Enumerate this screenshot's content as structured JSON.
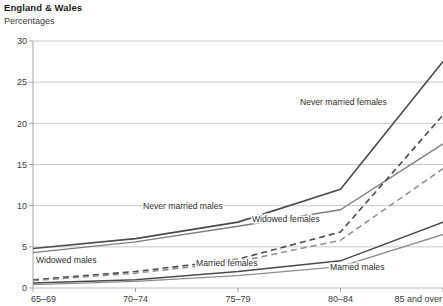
{
  "header": {
    "title": "England & Wales",
    "subtitle": "Percentages"
  },
  "chart_data": {
    "type": "line",
    "title": "England & Wales",
    "subtitle": "Percentages",
    "xlabel": "",
    "ylabel": "Percentages",
    "ylim": [
      0,
      30
    ],
    "yticks": [
      0,
      5,
      10,
      15,
      20,
      25,
      30
    ],
    "grid": true,
    "legend": "inline-annotations",
    "categories": [
      "65–69",
      "70–74",
      "75–79",
      "80–84",
      "85 and over"
    ],
    "series": [
      {
        "name": "Never married females",
        "values": [
          4.8,
          6.0,
          8.0,
          12.0,
          27.5
        ],
        "style": "solid",
        "color": "#4a4a4a",
        "width": 1.6,
        "label": "Never married females",
        "label_x": 300,
        "label_y": 105
      },
      {
        "name": "Never married males",
        "values": [
          4.3,
          5.6,
          7.5,
          9.5,
          17.5
        ],
        "style": "solid",
        "color": "#7d7d7d",
        "width": 1.4,
        "label": "Never married males",
        "label_x": 143,
        "label_y": 209
      },
      {
        "name": "Married females",
        "values": [
          1.0,
          2.0,
          3.5,
          6.8,
          21.0
        ],
        "style": "dashed",
        "color": "#4a4a4a",
        "width": 1.6,
        "label": "Married females",
        "label_x": 196,
        "label_y": 266
      },
      {
        "name": "Widowed females",
        "values": [
          0.9,
          1.8,
          3.2,
          5.8,
          14.5
        ],
        "style": "dashed",
        "color": "#8d8d8d",
        "width": 1.5,
        "label": "Widowed females",
        "label_x": 252,
        "label_y": 222
      },
      {
        "name": "Married males",
        "values": [
          0.6,
          1.0,
          2.0,
          3.3,
          8.0
        ],
        "style": "solid",
        "color": "#4a4a4a",
        "width": 1.5,
        "label": "Married males",
        "label_x": 330,
        "label_y": 270
      },
      {
        "name": "Widowed males",
        "values": [
          0.4,
          0.8,
          1.5,
          2.6,
          6.5
        ],
        "style": "solid",
        "color": "#8d8d8d",
        "width": 1.3,
        "label": "Widowed males",
        "label_x": 36,
        "label_y": 263
      }
    ]
  },
  "axis": {
    "y_labels": [
      "30",
      "25",
      "20",
      "15",
      "10",
      "5",
      "0"
    ],
    "x_labels": [
      "65–69",
      "70–74",
      "75–79",
      "80–84",
      "85 and over"
    ]
  },
  "colors": {
    "grid": "#bdbdbd",
    "axis": "#9a9a9a",
    "text": "#3a3a3a",
    "dark_series": "#4a4a4a",
    "light_series": "#8d8d8d"
  }
}
